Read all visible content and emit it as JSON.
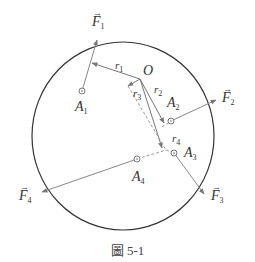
{
  "figure": {
    "caption": "圖 5-1",
    "origin_label": "O",
    "colors": {
      "circle": "#333333",
      "force_lines": "#888888",
      "radius_lines": "#777777",
      "dashed_lines": "#999999",
      "text": "#333333"
    },
    "forces": [
      {
        "name": "F",
        "sub": "1"
      },
      {
        "name": "F",
        "sub": "2"
      },
      {
        "name": "F",
        "sub": "3"
      },
      {
        "name": "F",
        "sub": "4"
      }
    ],
    "points": [
      {
        "name": "A",
        "sub": "1"
      },
      {
        "name": "A",
        "sub": "2"
      },
      {
        "name": "A",
        "sub": "3"
      },
      {
        "name": "A",
        "sub": "4"
      }
    ],
    "radii": [
      {
        "name": "r",
        "sub": "1"
      },
      {
        "name": "r",
        "sub": "2"
      },
      {
        "name": "r",
        "sub": "3"
      },
      {
        "name": "r",
        "sub": "4"
      }
    ],
    "vector_arrow": "→"
  }
}
